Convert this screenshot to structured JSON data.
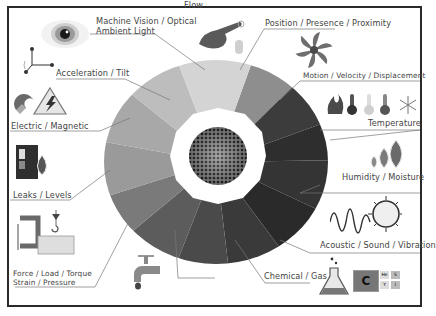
{
  "diagram": {
    "center": {
      "label": "sensor-mesh"
    },
    "labels": {
      "machine_vision_line1": "Machine Vision / Optical",
      "machine_vision_line2": "Ambient Light",
      "position": "Position / Presence / Proximity",
      "motion": "Motion / Velocity / Displacement",
      "temperature": "Temperature",
      "humidity": "Humidity / Moisture",
      "acoustic": "Acoustic / Sound / Vibration",
      "chemical": "Chemical / Gas",
      "flow": "Flow",
      "force_line1": "Force / Load / Torque",
      "force_line2": "Strain / Pressure",
      "leaks": "Leaks / Levels",
      "electric": "Electric / Magnetic",
      "acceleration": "Acceleration / Tilt"
    },
    "icons": [
      "eye-icon",
      "pointing-hand-icon",
      "fan-icon",
      "temperature-icons",
      "water-drops-icon",
      "sound-wave-icon",
      "flask-icon",
      "periodic-element-icon",
      "faucet-icon",
      "c-clamp-icon",
      "crane-hook-icon",
      "barrel-drop-icon",
      "magnet-icon",
      "high-voltage-icon",
      "axes-icon"
    ],
    "periodic": {
      "element": "C",
      "mini": [
        "He",
        "S",
        "Y",
        "I"
      ]
    },
    "colors": {
      "frame": "#2a2a2a",
      "segments": [
        "#8e8e8e",
        "#3c3c3c",
        "#2e2e2e",
        "#343434",
        "#3a3a3a",
        "#2a2a2a",
        "#4a4a4a",
        "#5c5c5c",
        "#7a7a7a",
        "#9a9a9a",
        "#a8a8a8",
        "#bdbdbd",
        "#d4d4d4"
      ]
    }
  }
}
